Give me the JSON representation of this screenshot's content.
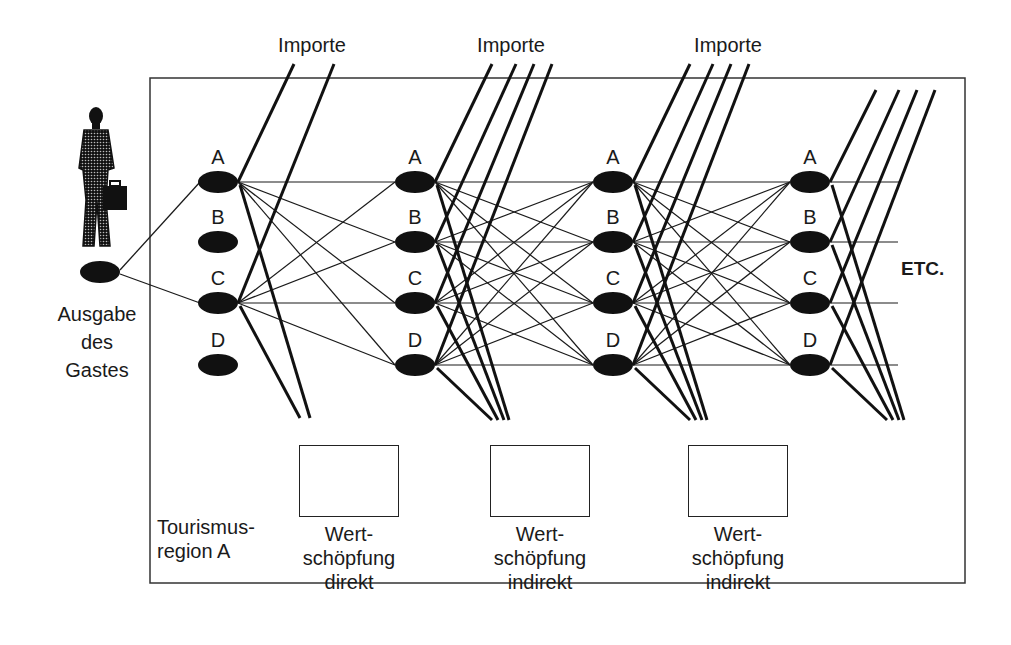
{
  "diagram": {
    "imports_label": "Importe",
    "imports_labels": [
      "Importe",
      "Importe",
      "Importe"
    ],
    "node_letters": [
      "A",
      "B",
      "C",
      "D"
    ],
    "etc_label": "ETC.",
    "guest": {
      "lines": [
        "Ausgabe",
        "des",
        "Gastes"
      ],
      "icon": "businessman-icon"
    },
    "region": {
      "lines": [
        "Tourismus-",
        "region A"
      ]
    },
    "value_added": [
      {
        "lines": [
          "Wert-",
          "schöpfung",
          "direkt"
        ],
        "icon": "money-stack-icon"
      },
      {
        "lines": [
          "Wert-",
          "schöpfung",
          "indirekt"
        ],
        "icon": "money-stack-icon"
      },
      {
        "lines": [
          "Wert-",
          "schöpfung",
          "indirekt"
        ],
        "icon": "money-stack-icon"
      }
    ],
    "colors": {
      "ink": "#1a1a1a",
      "background": "#ffffff"
    }
  }
}
